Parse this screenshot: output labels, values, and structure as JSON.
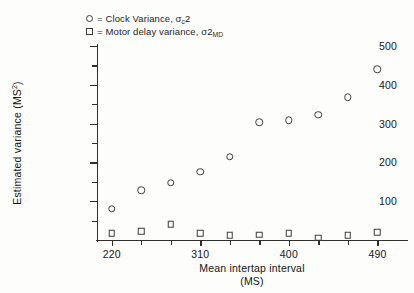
{
  "legend": {
    "items": [
      {
        "marker": "circle",
        "eq": "=",
        "text_before": "Clock Variance, σ",
        "sub": "c",
        "text_after": "2"
      },
      {
        "marker": "square",
        "eq": "=",
        "text_before": "Motor delay variance, σ2",
        "sub": "MD",
        "text_after": ""
      }
    ]
  },
  "axes": {
    "y_title_main": "Estimated variance (MS",
    "y_title_sup": "2",
    "y_title_tail": ")",
    "x_title_line1": "Mean intertap interval",
    "x_title_line2": "(MS)",
    "y_tick_labels": [
      "100",
      "200",
      "300",
      "400",
      "500"
    ],
    "x_tick_labels": [
      "220",
      "310",
      "400",
      "490"
    ]
  },
  "chart_data": {
    "type": "scatter",
    "title": "",
    "xlabel": "Mean intertap interval (MS)",
    "ylabel": "Estimated variance (MS2)",
    "xlim": [
      205,
      520
    ],
    "ylim": [
      0,
      500
    ],
    "x_ticks_major": [
      220,
      310,
      400,
      490
    ],
    "x_ticks_minor": [
      250,
      280,
      340,
      370,
      430,
      460
    ],
    "y_ticks_major": [
      100,
      200,
      300,
      400,
      500
    ],
    "y_ticks_minor": [
      50,
      150,
      250,
      350,
      450
    ],
    "grid": false,
    "legend_position": "top-left",
    "series": [
      {
        "name": "Clock Variance, σc2",
        "marker": "circle",
        "x": [
          220,
          250,
          280,
          310,
          340,
          370,
          400,
          430,
          460,
          490
        ],
        "values": [
          80,
          128,
          148,
          176,
          215,
          303,
          308,
          323,
          368,
          440
        ]
      },
      {
        "name": "Motor delay variance, σ2MD",
        "marker": "square",
        "x": [
          220,
          250,
          280,
          310,
          340,
          370,
          400,
          430,
          460,
          490
        ],
        "values": [
          18,
          22,
          40,
          18,
          12,
          14,
          18,
          6,
          12,
          20
        ]
      }
    ]
  }
}
